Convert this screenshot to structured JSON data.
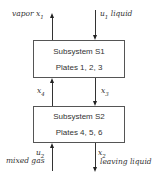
{
  "subsystems": [
    {
      "title": "Subsystem S1",
      "plates": "Plates 1, 2, 3"
    },
    {
      "title": "Subsystem S2",
      "plates": "Plates 4, 5, 6"
    }
  ],
  "streams": {
    "vapor": {
      "name": "vapor",
      "var": "x",
      "sub": "1"
    },
    "liquid_in": {
      "var": "u",
      "sub": "1",
      "name": "liquid"
    },
    "x4": {
      "var": "x",
      "sub": "4"
    },
    "x3": {
      "var": "x",
      "sub": "3"
    },
    "gas_in": {
      "var": "u",
      "sub": "2",
      "name": "mixed gas"
    },
    "liquid_out": {
      "var": "x",
      "sub": "2",
      "name": "leaving liquid"
    }
  }
}
